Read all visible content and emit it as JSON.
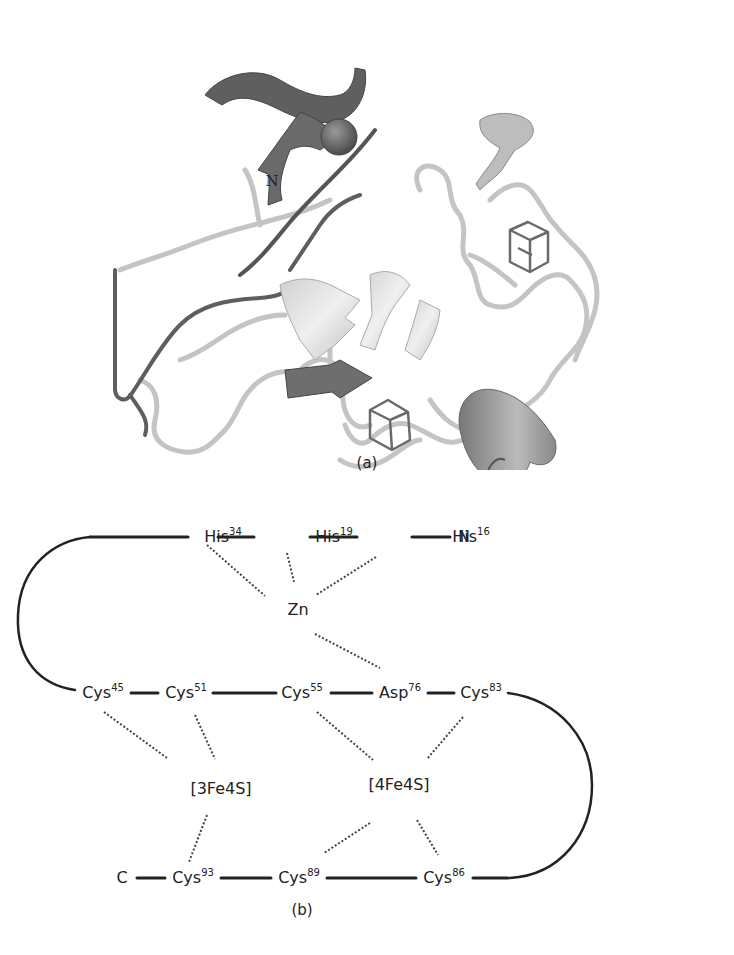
{
  "figure": {
    "panel_a": {
      "caption": "(a)",
      "description": "Ribbon diagram of protein structure with zinc ion sphere and two iron-sulfur clusters",
      "labels": {
        "n_terminus": "N"
      },
      "colors": {
        "dark_strand": "#5a5a5a",
        "light_coil": "#c8c8c8",
        "zinc_sphere": "#6a6a6a"
      }
    },
    "panel_b": {
      "caption": "(b)",
      "description": "Schematic of metal coordination in protein chain",
      "nodes": {
        "his34": {
          "name": "His",
          "num": "34"
        },
        "his19": {
          "name": "His",
          "num": "19"
        },
        "his16": {
          "name": "His",
          "num": "16"
        },
        "n_term": {
          "name": "N"
        },
        "zn": {
          "name": "Zn"
        },
        "cys45": {
          "name": "Cys",
          "num": "45"
        },
        "cys51": {
          "name": "Cys",
          "num": "51"
        },
        "cys55": {
          "name": "Cys",
          "num": "55"
        },
        "asp76": {
          "name": "Asp",
          "num": "76"
        },
        "cys83": {
          "name": "Cys",
          "num": "83"
        },
        "cluster_3fe4s": {
          "name": "[3Fe4S]"
        },
        "cluster_4fe4s": {
          "name": "[4Fe4S]"
        },
        "c_term": {
          "name": "C"
        },
        "cys93": {
          "name": "Cys",
          "num": "93"
        },
        "cys89": {
          "name": "Cys",
          "num": "89"
        },
        "cys86": {
          "name": "Cys",
          "num": "86"
        }
      },
      "backbone_order": [
        "N",
        "His16",
        "His19",
        "His34",
        "Cys45",
        "Cys51",
        "Cys55",
        "Asp76",
        "Cys83",
        "Cys86",
        "Cys89",
        "Cys93",
        "C"
      ],
      "coordination": [
        {
          "metal": "Zn",
          "ligands": [
            "His34",
            "His19",
            "His16",
            "Asp76"
          ]
        },
        {
          "metal": "[3Fe4S]",
          "ligands": [
            "Cys45",
            "Cys51",
            "Cys93"
          ]
        },
        {
          "metal": "[4Fe4S]",
          "ligands": [
            "Cys55",
            "Cys83",
            "Cys89",
            "Cys86"
          ]
        }
      ]
    }
  }
}
